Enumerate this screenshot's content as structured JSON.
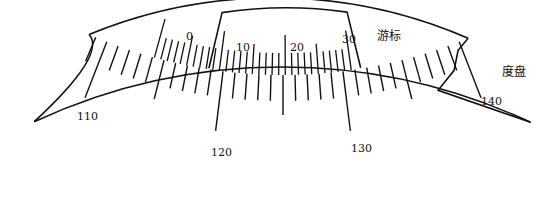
{
  "diagram": {
    "title": "",
    "vernier": {
      "label": "游标",
      "tick_labels": [
        "0",
        "10",
        "20",
        "30"
      ],
      "divisions": 30
    },
    "dial": {
      "label": "度盘",
      "tick_labels": [
        "110",
        "120",
        "130",
        "140"
      ],
      "range": [
        108,
        143
      ]
    },
    "colors": {
      "line": "#111111",
      "background": "#ffffff"
    }
  }
}
